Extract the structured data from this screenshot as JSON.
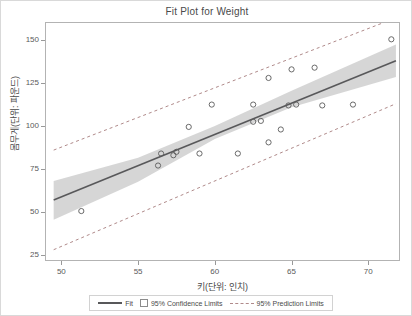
{
  "chart_data": {
    "type": "scatter",
    "title": "Fit Plot for Weight",
    "xlabel": "키(단위: 인치)",
    "ylabel": "몸무게(단위: 파운드)",
    "xlim": [
      49.0,
      72.0
    ],
    "ylim": [
      22.0,
      160.0
    ],
    "xticks": [
      50,
      55,
      60,
      65,
      70
    ],
    "yticks": [
      25,
      50,
      75,
      100,
      125,
      150
    ],
    "grid": false,
    "legend_position": "bottom",
    "x": [
      51.3,
      56.3,
      56.5,
      57.3,
      57.5,
      58.3,
      59.0,
      59.8,
      61.5,
      62.5,
      62.5,
      63.0,
      63.5,
      63.5,
      64.3,
      64.8,
      65.0,
      65.3,
      66.5,
      67.0,
      69.0,
      71.5
    ],
    "y": [
      50.5,
      77.0,
      84.0,
      83.0,
      85.0,
      99.5,
      84.0,
      112.5,
      84.0,
      102.5,
      112.5,
      103.0,
      90.5,
      128.0,
      98.0,
      112.0,
      133.0,
      112.5,
      134.0,
      112.0,
      112.5,
      150.5
    ],
    "points": [
      {
        "x": 51.3,
        "y": 50.5
      },
      {
        "x": 56.3,
        "y": 77.0
      },
      {
        "x": 56.5,
        "y": 84.0
      },
      {
        "x": 57.3,
        "y": 83.0
      },
      {
        "x": 57.5,
        "y": 85.0
      },
      {
        "x": 58.3,
        "y": 99.5
      },
      {
        "x": 59.0,
        "y": 84.0
      },
      {
        "x": 59.8,
        "y": 112.5
      },
      {
        "x": 61.5,
        "y": 84.0
      },
      {
        "x": 62.5,
        "y": 102.5
      },
      {
        "x": 62.5,
        "y": 112.5
      },
      {
        "x": 63.0,
        "y": 103.0
      },
      {
        "x": 63.5,
        "y": 90.5
      },
      {
        "x": 63.5,
        "y": 128.0
      },
      {
        "x": 64.3,
        "y": 98.0
      },
      {
        "x": 64.8,
        "y": 112.0
      },
      {
        "x": 65.0,
        "y": 133.0
      },
      {
        "x": 65.3,
        "y": 112.5
      },
      {
        "x": 66.5,
        "y": 134.0
      },
      {
        "x": 67.0,
        "y": 112.0
      },
      {
        "x": 69.0,
        "y": 112.5
      },
      {
        "x": 71.5,
        "y": 150.5
      }
    ],
    "fit_line": {
      "x": [
        49.5,
        71.8
      ],
      "y": [
        57.0,
        138.0
      ]
    },
    "confidence_band": {
      "x": [
        49.5,
        55.0,
        60.0,
        65.0,
        71.8
      ],
      "upper": [
        68.0,
        81.5,
        100.0,
        120.5,
        147.5
      ],
      "lower": [
        45.5,
        67.5,
        92.5,
        111.0,
        128.5
      ]
    },
    "prediction_band": {
      "x": [
        49.5,
        71.8
      ],
      "upper": [
        86.0,
        163.0
      ],
      "lower": [
        28.0,
        113.0
      ]
    },
    "series": [
      {
        "name": "Fit",
        "type": "line",
        "color": "#58585a"
      },
      {
        "name": "95% Confidence Limits",
        "type": "band",
        "color": "#d4d4d4"
      },
      {
        "name": "95% Prediction Limits",
        "type": "dashed-line",
        "color": "#b08a8a"
      }
    ]
  },
  "legend": {
    "items": [
      {
        "label": "Fit",
        "swatch": "line"
      },
      {
        "label": "95% Confidence Limits",
        "swatch": "box"
      },
      {
        "label": "95% Prediction Limits",
        "swatch": "dash"
      }
    ]
  },
  "colors": {
    "marker_stroke": "#5a5a5a",
    "fit_line": "#58585a",
    "confidence_fill": "#d4d4d4",
    "prediction_line": "#b08a8a",
    "frame": "#b3b3b3",
    "text": "#4a4a4a"
  }
}
